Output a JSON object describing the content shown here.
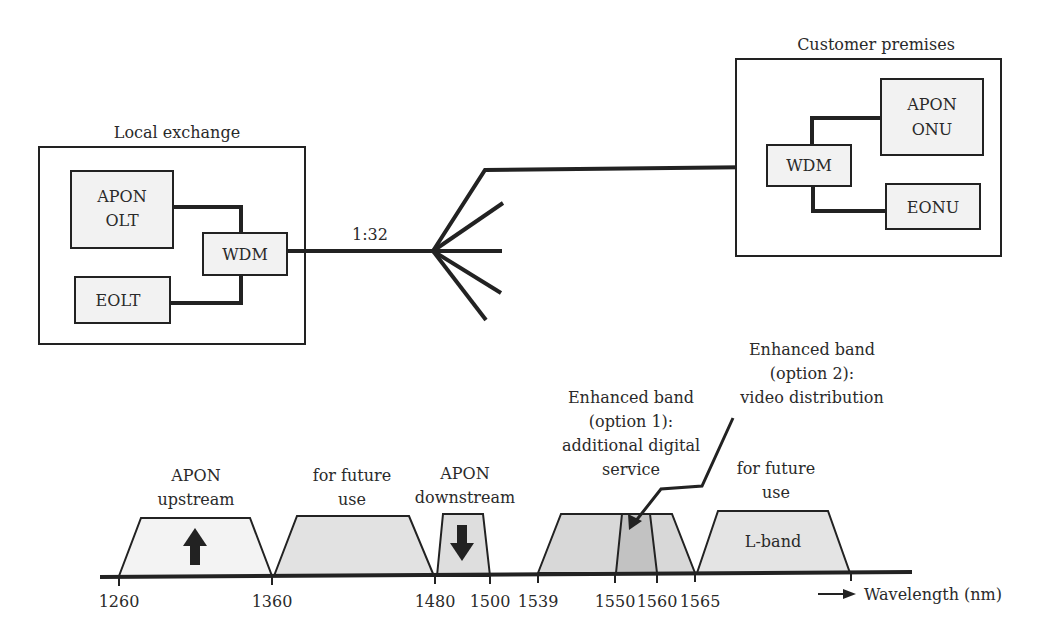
{
  "network": {
    "local_exchange": {
      "title": "Local exchange",
      "olt_line1": "APON",
      "olt_line2": "OLT",
      "eolt": "EOLT",
      "wdm": "WDM"
    },
    "split_ratio": "1:32",
    "customer_premises": {
      "title": "Customer premises",
      "onu_line1": "APON",
      "onu_line2": "ONU",
      "eonu": "EONU",
      "wdm": "WDM"
    }
  },
  "spectrum": {
    "axis_label": "Wavelength (nm)",
    "ticks": [
      "1260",
      "1360",
      "1480",
      "1500",
      "1539",
      "1550",
      "1560",
      "1565"
    ],
    "bands": {
      "upstream": {
        "line1": "APON",
        "line2": "upstream"
      },
      "future1": {
        "line1": "for future",
        "line2": "use"
      },
      "downstream": {
        "line1": "APON",
        "line2": "downstream"
      },
      "enh1": {
        "line1": "Enhanced band",
        "line2": "(option 1):",
        "line3": "additional digital",
        "line4": "service"
      },
      "enh2": {
        "line1": "Enhanced band",
        "line2": "(option 2):",
        "line3": "video distribution"
      },
      "future2": {
        "line1": "for future",
        "line2": "use",
        "inner": "L-band"
      }
    },
    "colors": {
      "light_fill": "#f1f1f1",
      "mid_fill": "#dcdcdc",
      "dark_fill": "#c4c4c4",
      "stroke": "#222222"
    }
  }
}
